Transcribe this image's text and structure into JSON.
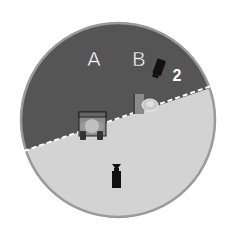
{
  "diagram": {
    "labels": {
      "a": "A",
      "b": "B",
      "count": "2"
    },
    "colors": {
      "dark_region": "#555555",
      "light_region": "#d3d3d3",
      "rim": "#9a9a9a",
      "divider": "#ffffff",
      "icon_dark": "#111111",
      "icon_mid": "#7a7a7a",
      "icon_light": "#c8c8c8",
      "label_text": "#ffffff"
    },
    "icons": [
      "camera-icon",
      "desk-with-person-icon",
      "podium-with-speaker-icon",
      "camera-bottom-icon"
    ]
  }
}
